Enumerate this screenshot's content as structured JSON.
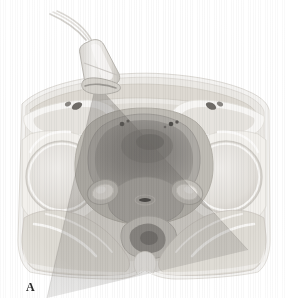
{
  "figure": {
    "panel_label": "A",
    "modality": "transabdominal-ultrasound-anatomic-cross-section",
    "view": "axial-pelvis",
    "background_color": "#ffffff"
  },
  "palette": {
    "background": "#ffffff",
    "skin_outline": "#f2f1ef",
    "subcutaneous_fat": "#eceae6",
    "muscle_light": "#dedbd5",
    "muscle_mid": "#cfcbc4",
    "muscle_dark": "#bdb9b1",
    "bone_cortex": "#fbfaf8",
    "bone_marrow": "#e4e1db",
    "bladder_lumen": "#8f8c88",
    "bladder_wall": "#a8a5a0",
    "uterus": "#9b9894",
    "rectum_dark": "#7e7b77",
    "vessel_dark": "#4a4845",
    "probe_body": "#e9e7e3",
    "probe_edge": "#bdbab4",
    "beam_overlay": "rgba(105,102,98,0.28)",
    "label_color": "#2b2b2b"
  },
  "probe": {
    "name": "curvilinear-ultrasound-transducer",
    "cable_strands": 3,
    "contact_point": {
      "x": 96,
      "y": 84
    }
  },
  "beam": {
    "name": "ultrasound-sector-beam",
    "apex": {
      "x": 96,
      "y": 84
    },
    "left_edge": {
      "x": 47,
      "y": 298
    },
    "right_edge": {
      "x": 248,
      "y": 250
    },
    "opacity": 0.28
  },
  "anatomy": [
    {
      "id": "abdominal-wall",
      "label": "anterior abdominal wall"
    },
    {
      "id": "bladder",
      "label": "urinary bladder"
    },
    {
      "id": "uterus",
      "label": "uterus"
    },
    {
      "id": "left-femoral-head",
      "label": "left femoral head"
    },
    {
      "id": "right-femoral-head",
      "label": "right femoral head"
    },
    {
      "id": "left-acetabulum",
      "label": "left acetabulum"
    },
    {
      "id": "right-acetabulum",
      "label": "right acetabulum"
    },
    {
      "id": "rectum",
      "label": "rectum"
    },
    {
      "id": "vagina",
      "label": "vagina"
    },
    {
      "id": "left-adnexa",
      "label": "left adnexa"
    },
    {
      "id": "right-adnexa",
      "label": "right adnexa"
    },
    {
      "id": "gluteal-muscles",
      "label": "gluteal muscles"
    },
    {
      "id": "iliac-vessels",
      "label": "iliac vessels"
    },
    {
      "id": "sacrum-coccyx",
      "label": "sacrum / coccyx"
    }
  ]
}
